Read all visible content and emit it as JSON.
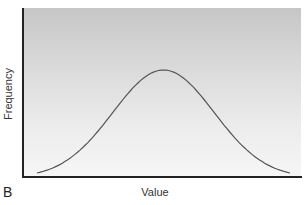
{
  "chart_data": {
    "type": "line",
    "title": "",
    "panel_label": "B",
    "xlabel": "Value",
    "ylabel": "Frequency",
    "grid": false,
    "legend": null,
    "x": [
      0,
      0.1,
      0.2,
      0.3,
      0.4,
      0.5,
      0.6,
      0.7,
      0.8,
      0.9,
      1.0
    ],
    "series": [
      {
        "name": "distribution",
        "values": [
          0.03,
          0.09,
          0.24,
          0.5,
          0.82,
          1.0,
          0.82,
          0.5,
          0.24,
          0.09,
          0.03
        ]
      }
    ],
    "xlim": [
      0,
      1
    ],
    "ylim": [
      0,
      1.05
    ]
  },
  "labels": {
    "panel": "B",
    "x_axis": "Value",
    "y_axis": "Frequency"
  },
  "colors": {
    "curve": "#555555",
    "axis": "#222222",
    "bg_top": "#c6c6c6",
    "bg_bottom": "#f6f6f6"
  }
}
